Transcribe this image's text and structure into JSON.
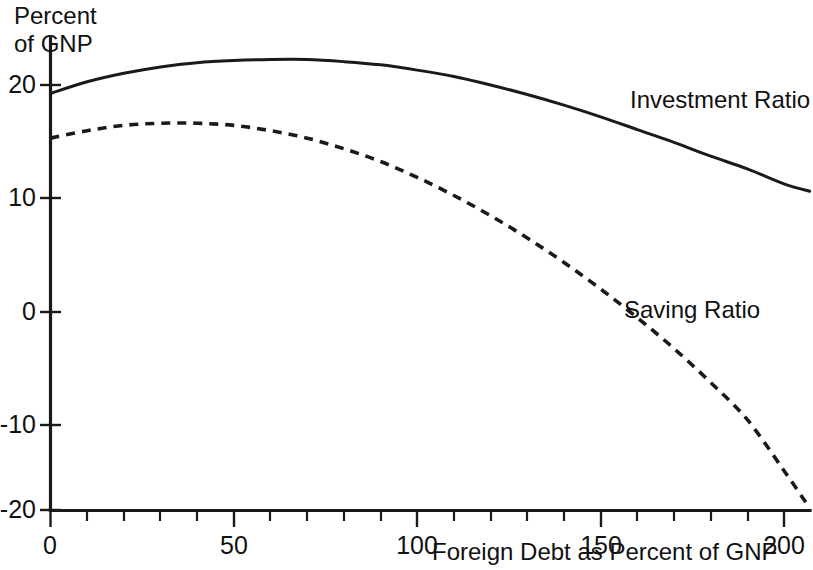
{
  "chart_data": {
    "type": "line",
    "title": "",
    "subtitle": "",
    "xlabel": "Foreign Debt as Percent of GNP",
    "ylabel": "Percent\nof GNP",
    "ylabel_line1": "Percent",
    "ylabel_line2": "of GNP",
    "xlim": [
      0,
      207
    ],
    "ylim": [
      -20,
      24
    ],
    "xticks": [
      0,
      50,
      100,
      150,
      200
    ],
    "xticklabels": [
      "0",
      "50",
      "100",
      "150",
      "200"
    ],
    "xminor_tick_step": 10,
    "yticks": [
      -20,
      -10,
      0,
      10,
      20
    ],
    "yticklabels": [
      "-20",
      "-10",
      "0",
      "10",
      "20"
    ],
    "grid": false,
    "legend_position": "inline-annotations",
    "annotations": [
      {
        "text": "Investment Ratio",
        "x": 150,
        "y": 17.5
      },
      {
        "text": "Saving Ratio",
        "x": 152,
        "y": 0.8
      }
    ],
    "series": [
      {
        "name": "Investment Ratio",
        "style": "solid",
        "color": "#1a1a1a",
        "x": [
          0,
          10,
          20,
          30,
          40,
          50,
          60,
          70,
          80,
          90,
          100,
          110,
          120,
          130,
          140,
          150,
          160,
          170,
          180,
          190,
          200,
          207
        ],
        "values": [
          19.2,
          20.3,
          21.1,
          21.7,
          22.1,
          22.3,
          22.4,
          22.4,
          22.2,
          21.9,
          21.4,
          20.8,
          20.0,
          19.1,
          18.1,
          17.0,
          15.8,
          14.6,
          13.3,
          12.1,
          10.7,
          10.0
        ]
      },
      {
        "name": "Saving Ratio",
        "style": "dashed",
        "color": "#1a1a1a",
        "x": [
          0,
          10,
          20,
          30,
          40,
          50,
          60,
          70,
          80,
          90,
          100,
          110,
          120,
          130,
          140,
          150,
          160,
          170,
          180,
          190,
          200,
          207
        ],
        "values": [
          15.0,
          15.7,
          16.2,
          16.4,
          16.4,
          16.2,
          15.7,
          15.0,
          14.0,
          12.8,
          11.3,
          9.6,
          7.7,
          5.6,
          3.3,
          0.8,
          -1.9,
          -4.8,
          -8.0,
          -11.5,
          -16.3,
          -19.8
        ]
      }
    ]
  },
  "axes": {
    "y_axis_name": "percent-of-gnp-axis",
    "x_axis_name": "foreign-debt-axis"
  }
}
